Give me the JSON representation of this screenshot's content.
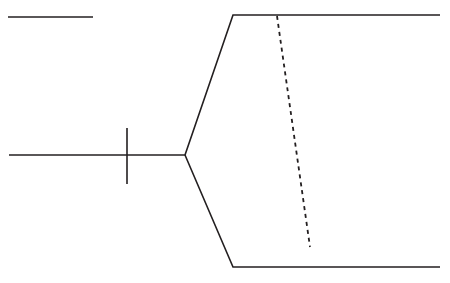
{
  "figure": {
    "width": 450,
    "height": 283,
    "background_color": "#ffffff",
    "stroke_color": "#231f20",
    "stroke_width": 1.6,
    "dash_stroke_width": 1.8,
    "dash_pattern": "4 4"
  },
  "chart_data": {
    "type": "line",
    "title": "",
    "xlabel": "",
    "ylabel": "",
    "grid": false,
    "legend": "none",
    "xlim": [
      0,
      450
    ],
    "ylim": [
      283,
      0
    ],
    "coordinate_space": "pixels, origin top-left",
    "series": [
      {
        "name": "scale-bar",
        "style": "solid",
        "color": "#231f20",
        "points": [
          [
            8,
            17
          ],
          [
            93,
            17
          ]
        ]
      },
      {
        "name": "root-stem",
        "style": "solid",
        "color": "#231f20",
        "points": [
          [
            9,
            155
          ],
          [
            185,
            155
          ]
        ]
      },
      {
        "name": "support-tick",
        "style": "solid",
        "color": "#231f20",
        "points": [
          [
            127,
            128
          ],
          [
            127,
            184
          ]
        ]
      },
      {
        "name": "upper-clade-path",
        "style": "solid",
        "color": "#231f20",
        "points": [
          [
            185,
            155
          ],
          [
            233,
            15
          ],
          [
            440,
            15
          ]
        ]
      },
      {
        "name": "lower-clade-path",
        "style": "solid",
        "color": "#231f20",
        "points": [
          [
            185,
            155
          ],
          [
            233,
            267
          ],
          [
            440,
            267
          ]
        ]
      },
      {
        "name": "reference-divider",
        "style": "dashed",
        "color": "#231f20",
        "points": [
          [
            277,
            16
          ],
          [
            310,
            247
          ]
        ]
      }
    ]
  },
  "elements": {
    "scale_bar": {
      "name": "scale bar",
      "x1": 8,
      "y1": 17,
      "x2": 93,
      "y2": 17
    },
    "root_stem": {
      "name": "root stem",
      "x1": 9,
      "y1": 155,
      "x2": 185,
      "y2": 155
    },
    "support_tick": {
      "name": "node support tick",
      "x1": 127,
      "y1": 128,
      "x2": 127,
      "y2": 184
    },
    "upper_branch": {
      "name": "upper branch",
      "path": "M185,155 L233,15 L440,15"
    },
    "lower_branch": {
      "name": "lower branch",
      "path": "M185,155 L233,267 L440,267"
    },
    "reference_line": {
      "name": "dashed reference line",
      "path": "M277,16 L310,247"
    },
    "node": {
      "name": "bifurcation node",
      "x": 185,
      "y": 155
    }
  }
}
